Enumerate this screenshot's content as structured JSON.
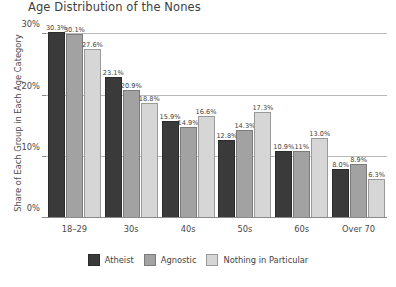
{
  "chart_data": {
    "type": "bar",
    "title": "Age Distribution of the Nones",
    "xlabel": "",
    "ylabel": "Share of Each Group in Each Age Category",
    "categories": [
      "18–29",
      "30s",
      "40s",
      "50s",
      "60s",
      "Over 70"
    ],
    "series": [
      {
        "name": "Atheist",
        "color": "#3a3a3a",
        "values": [
          30.3,
          23.1,
          15.9,
          12.8,
          10.9,
          8.0
        ],
        "labels": [
          "30.3%",
          "23.1%",
          "15.9%",
          "12.8%",
          "10.9%",
          "8.0%"
        ]
      },
      {
        "name": "Agnostic",
        "color": "#a2a2a2",
        "values": [
          30.1,
          20.9,
          14.9,
          14.3,
          11.0,
          8.9
        ],
        "labels": [
          "30.1%",
          "20.9%",
          "14.9%",
          "14.3%",
          "11%",
          "8.9%"
        ]
      },
      {
        "name": "Nothing in Particular",
        "color": "#d6d6d6",
        "values": [
          27.6,
          18.8,
          16.6,
          17.3,
          13.0,
          6.3
        ],
        "labels": [
          "27.6%",
          "18.8%",
          "16.6%",
          "17.3%",
          "13.0%",
          "6.3%"
        ]
      }
    ],
    "ylim": [
      0,
      32
    ],
    "yticks": [
      0,
      10,
      20,
      30
    ],
    "ytick_labels": [
      "0%",
      "10%",
      "20%",
      "30%"
    ],
    "grid": true,
    "legend_position": "bottom"
  }
}
